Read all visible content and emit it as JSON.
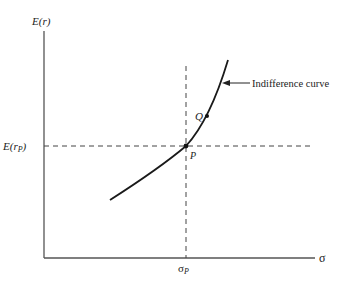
{
  "diagram": {
    "y_axis_label": "E(r)",
    "x_axis_label": "σ",
    "h_ref_label": "E(r",
    "h_ref_sub": "P",
    "h_ref_close": ")",
    "v_ref_label": "σ",
    "v_ref_sub": "P",
    "curve_label": "Indifference curve",
    "point_p_label": "P",
    "point_q_label": "Q",
    "colors": {
      "axis": "#555555",
      "curve": "#1a1a1a",
      "dashed": "#444444",
      "text": "#222222"
    }
  }
}
